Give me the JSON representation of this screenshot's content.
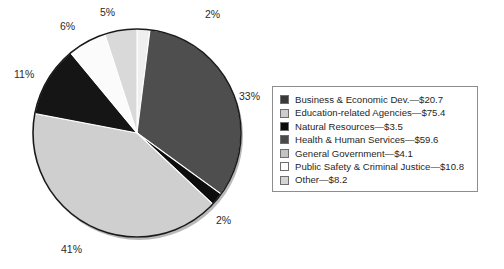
{
  "chart_data": {
    "type": "pie",
    "title": "",
    "unit": "$ billions",
    "total": 182.3,
    "legend_position": "right",
    "start_angle_deg": 0,
    "direction": "clockwise",
    "categories": [
      "Other",
      "Business & Economic Dev.",
      "Natural Resources",
      "Education-related Agencies",
      "Health & Human Services",
      "Public Safety & Criminal Justice",
      "General Government"
    ],
    "values": [
      8.2,
      59.6,
      3.5,
      75.4,
      20.7,
      10.8,
      4.1
    ],
    "percents": [
      2,
      33,
      2,
      41,
      11,
      6,
      5
    ],
    "slices": [
      {
        "name": "Other",
        "percent": 2,
        "value": 8.2,
        "color": "#efefef",
        "label": "2%",
        "label_x": 205,
        "label_y": 8
      },
      {
        "name": "Business & Economic Dev.",
        "percent": 33,
        "value": 59.6,
        "color": "#4e4e4e",
        "label": "33%",
        "label_x": 239,
        "label_y": 90
      },
      {
        "name": "Natural Resources",
        "percent": 2,
        "value": 3.5,
        "color": "#0d0d0d",
        "label": "2%",
        "label_x": 216,
        "label_y": 214
      },
      {
        "name": "Education-related Agencies",
        "percent": 41,
        "value": 75.4,
        "color": "#cfcfcf",
        "label": "41%",
        "label_x": 61,
        "label_y": 243
      },
      {
        "name": "Health & Human Services",
        "percent": 11,
        "value": 20.7,
        "color": "#151515",
        "label": "11%",
        "label_x": 14,
        "label_y": 68
      },
      {
        "name": "Public Safety & Criminal Justice",
        "percent": 6,
        "value": 10.8,
        "color": "#fbfbfb",
        "label": "6%",
        "label_x": 60,
        "label_y": 20
      },
      {
        "name": "General Government",
        "percent": 5,
        "value": 4.1,
        "color": "#d9d9d9",
        "label": "5%",
        "label_x": 100,
        "label_y": 6
      }
    ],
    "geometry": {
      "cx": 137,
      "cy": 133,
      "r": 104
    }
  },
  "legend": {
    "items": [
      {
        "label": "Business & Economic Dev.—$20.7",
        "swatch": "#3a3a3a"
      },
      {
        "label": "Education-related Agencies—$75.4",
        "swatch": "#cdcdcd"
      },
      {
        "label": "Natural Resources—$3.5",
        "swatch": "#0a0a0a"
      },
      {
        "label": "Health & Human Services—$59.6",
        "swatch": "#4a4a4a"
      },
      {
        "label": "General Government—$4.1",
        "swatch": "#c3c3c3"
      },
      {
        "label": "Public Safety & Criminal Justice—$10.8",
        "swatch": "#fcfcfc"
      },
      {
        "label": "Other—$8.2",
        "swatch": "#d5d5d5"
      }
    ]
  }
}
